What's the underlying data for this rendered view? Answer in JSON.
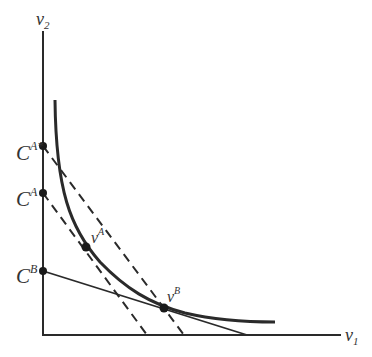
{
  "diagram": {
    "axes": {
      "y_label": "v",
      "y_label_sub": "2",
      "x_label": "v",
      "x_label_sub": "1"
    },
    "intercepts": [
      {
        "id": "CAstar",
        "base": "C",
        "sup": "A*",
        "y": 146
      },
      {
        "id": "CA",
        "base": "C",
        "sup": "A",
        "y": 193
      },
      {
        "id": "CB",
        "base": "C",
        "sup": "B",
        "y": 271
      }
    ],
    "points": [
      {
        "id": "vA",
        "base": "v",
        "sup": "A",
        "x": 86,
        "y": 247
      },
      {
        "id": "vB",
        "base": "v",
        "sup": "B",
        "x": 164,
        "y": 308
      }
    ],
    "lines": [
      {
        "id": "budget-CAstar",
        "style": "dashed",
        "from": [
          43,
          146
        ],
        "to": [
          184,
          335
        ]
      },
      {
        "id": "budget-CA",
        "style": "dashed",
        "from": [
          43,
          193
        ],
        "to": [
          147,
          335
        ]
      },
      {
        "id": "budget-CB",
        "style": "solid",
        "from": [
          43,
          271
        ],
        "to": [
          247,
          335
        ]
      }
    ],
    "curve": {
      "id": "indifference-curve",
      "style": "solid-thick"
    },
    "colors": {
      "ink": "#2a2a2a",
      "label": "#333333",
      "background": "#ffffff"
    }
  }
}
